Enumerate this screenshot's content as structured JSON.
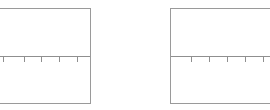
{
  "figure": {
    "background_color": "#ffffff",
    "frame_color": "#9a9a9a",
    "axis_color": "#8f8f8f",
    "panel_count": 2
  },
  "panels": [
    {
      "id": "left",
      "name": "left-plot-panel",
      "clipped_edge": "left",
      "frame": {
        "left": -24,
        "top": 8,
        "width": 115,
        "height": 96
      },
      "axis": {
        "orientation": "horizontal",
        "y": 47,
        "tick_direction": "down",
        "tick_length": 5,
        "tick_positions": [
          26,
          47,
          64,
          82,
          100
        ],
        "tick_labels": []
      }
    },
    {
      "id": "right",
      "name": "right-plot-panel",
      "clipped_edge": "right",
      "frame": {
        "left": 170,
        "top": 8,
        "width": 115,
        "height": 96
      },
      "axis": {
        "orientation": "horizontal",
        "y": 47,
        "tick_direction": "down",
        "tick_length": 5,
        "tick_positions": [
          20,
          38,
          56,
          74,
          92
        ],
        "tick_labels": []
      }
    }
  ],
  "chart_data": {
    "type": "line",
    "title": "",
    "subtitle": "",
    "xlabel": "",
    "ylabel": "",
    "legend": [],
    "annotations": [],
    "grid": false,
    "series": [],
    "subplots": [
      {
        "name": "left",
        "x": [],
        "y": [],
        "xticks": [],
        "xticklabels": [],
        "yticks": [],
        "yticklabels": []
      },
      {
        "name": "right",
        "x": [],
        "y": [],
        "xticks": [],
        "xticklabels": [],
        "yticks": [],
        "yticklabels": []
      }
    ]
  }
}
